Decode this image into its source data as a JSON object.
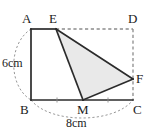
{
  "figure": {
    "type": "geometry-diagram",
    "width": 148,
    "height": 133,
    "background_color": "#ffffff",
    "stroke_color": "#2b2b2b",
    "dash_color": "#8c8c8c",
    "shade_color": "#e9e9e9",
    "label_color": "#1b1b1b"
  },
  "vertices": [
    {
      "name": "A",
      "label": "A",
      "x": 31,
      "y": 29,
      "label_x": 22,
      "label_y": 12
    },
    {
      "name": "E",
      "label": "E",
      "x": 56,
      "y": 29,
      "label_x": 49,
      "label_y": 12
    },
    {
      "name": "D",
      "label": "D",
      "x": 133,
      "y": 29,
      "label_x": 128,
      "label_y": 12
    },
    {
      "name": "F",
      "label": "F",
      "x": 133,
      "y": 79,
      "label_x": 136,
      "label_y": 72
    },
    {
      "name": "C",
      "label": "C",
      "x": 133,
      "y": 100,
      "label_x": 133,
      "label_y": 103
    },
    {
      "name": "M",
      "label": "M",
      "x": 83,
      "y": 100,
      "label_x": 77,
      "label_y": 103
    },
    {
      "name": "B",
      "label": "B",
      "x": 31,
      "y": 100,
      "label_x": 20,
      "label_y": 103
    }
  ],
  "measures": [
    {
      "name": "height",
      "label": "6cm",
      "label_x": 2,
      "label_y": 57
    },
    {
      "name": "width",
      "label": "8cm",
      "label_x": 66,
      "label_y": 117
    }
  ],
  "segments": {
    "solid": [
      {
        "name": "A-E",
        "x1": 31,
        "y1": 29,
        "x2": 56,
        "y2": 29
      },
      {
        "name": "A-B",
        "x1": 31,
        "y1": 29,
        "x2": 31,
        "y2": 100
      },
      {
        "name": "B-M",
        "x1": 31,
        "y1": 100,
        "x2": 83,
        "y2": 100
      },
      {
        "name": "M-C",
        "x1": 83,
        "y1": 100,
        "x2": 133,
        "y2": 100
      },
      {
        "name": "E-M",
        "x1": 56,
        "y1": 29,
        "x2": 83,
        "y2": 100
      },
      {
        "name": "E-F",
        "x1": 56,
        "y1": 29,
        "x2": 133,
        "y2": 79
      },
      {
        "name": "M-F",
        "x1": 83,
        "y1": 100,
        "x2": 133,
        "y2": 79
      }
    ],
    "dashed": [
      {
        "name": "E-D",
        "x1": 56,
        "y1": 29,
        "x2": 133,
        "y2": 29
      },
      {
        "name": "D-C",
        "x1": 133,
        "y1": 29,
        "x2": 133,
        "y2": 100
      }
    ]
  },
  "shaded_region": {
    "name": "triangle-EMF",
    "points": "56,29 83,100 133,79"
  },
  "arcs": [
    {
      "name": "left-arc-AB",
      "path": "M 31 29 C 8 44, 8 86, 31 100"
    },
    {
      "name": "bottom-arc-BC",
      "path": "M 31 100 C 50 124, 114 124, 133 100"
    }
  ],
  "ticks": [
    {
      "name": "tick-BM",
      "x": 57,
      "y": 100
    },
    {
      "name": "tick-MC",
      "x": 108,
      "y": 100
    }
  ]
}
